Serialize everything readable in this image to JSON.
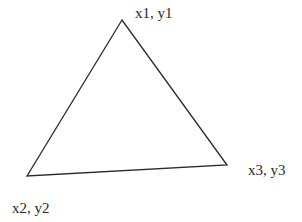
{
  "diagram": {
    "type": "triangle",
    "stroke_color": "#2a2a2a",
    "vertices": [
      {
        "id": "v1",
        "x": 122,
        "y": 20,
        "label": "x1, y1",
        "label_x": 135,
        "label_y": 6
      },
      {
        "id": "v2",
        "x": 27,
        "y": 176,
        "label": "x2, y2",
        "label_x": 12,
        "label_y": 201
      },
      {
        "id": "v3",
        "x": 227,
        "y": 165,
        "label": "x3, y3",
        "label_x": 248,
        "label_y": 163
      }
    ]
  }
}
